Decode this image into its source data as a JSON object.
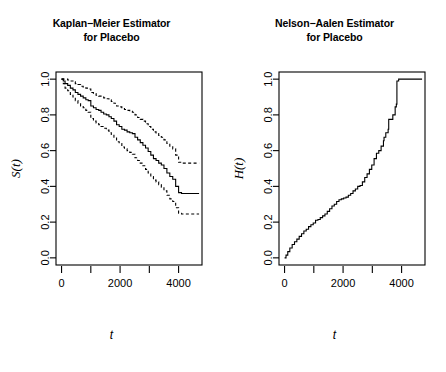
{
  "figure": {
    "background": "#ffffff",
    "line_color": "#000000",
    "width": 446,
    "height": 372
  },
  "panels": [
    {
      "name": "kaplan-meier",
      "title_line1": "Kaplan−Meier Estimator",
      "title_line2": "for Placebo",
      "xlabel": "t",
      "ylabel": "S(t)"
    },
    {
      "name": "nelson-aalen",
      "title_line1": "Nelson−Aalen Estimator",
      "title_line2": "for Placebo",
      "xlabel": "t",
      "ylabel": "H(t)"
    }
  ],
  "chart_data": [
    {
      "type": "line",
      "name": "kaplan-meier",
      "title": "Kaplan−Meier Estimator for Placebo",
      "xlabel": "t",
      "ylabel": "S(t)",
      "xlim": [
        -190,
        4800
      ],
      "ylim": [
        -0.04,
        1.04
      ],
      "xticks": [
        0,
        1000,
        2000,
        3000,
        4000
      ],
      "xtick_labels": [
        "0",
        "",
        "2000",
        "",
        "4000"
      ],
      "yticks": [
        0.0,
        0.2,
        0.4,
        0.6,
        0.8,
        1.0
      ],
      "ytick_labels": [
        "0.0",
        "0.2",
        "0.4",
        "0.6",
        "0.8",
        "1.0"
      ],
      "grid": false,
      "legend": null,
      "series": [
        {
          "name": "survival-estimate",
          "style": "solid",
          "step": true,
          "x": [
            0,
            60,
            120,
            210,
            300,
            390,
            470,
            560,
            650,
            740,
            830,
            910,
            1000,
            1090,
            1180,
            1270,
            1350,
            1440,
            1530,
            1620,
            1700,
            1790,
            1880,
            1970,
            2060,
            2150,
            2240,
            2330,
            2420,
            2510,
            2600,
            2690,
            2780,
            2870,
            2960,
            3050,
            3140,
            3230,
            3320,
            3410,
            3500,
            3600,
            3700,
            3800,
            3900,
            4000,
            4100,
            4700
          ],
          "y": [
            1.0,
            0.99,
            0.975,
            0.965,
            0.95,
            0.94,
            0.925,
            0.915,
            0.905,
            0.895,
            0.885,
            0.88,
            0.85,
            0.84,
            0.83,
            0.825,
            0.815,
            0.805,
            0.8,
            0.79,
            0.78,
            0.765,
            0.745,
            0.735,
            0.72,
            0.715,
            0.705,
            0.7,
            0.695,
            0.675,
            0.66,
            0.645,
            0.63,
            0.615,
            0.595,
            0.575,
            0.555,
            0.545,
            0.53,
            0.52,
            0.5,
            0.475,
            0.455,
            0.44,
            0.4,
            0.365,
            0.36,
            0.36
          ]
        },
        {
          "name": "upper-confidence-band",
          "style": "dashed",
          "step": true,
          "x": [
            0,
            60,
            120,
            210,
            300,
            390,
            470,
            560,
            650,
            740,
            830,
            910,
            1000,
            1090,
            1180,
            1270,
            1350,
            1440,
            1530,
            1620,
            1700,
            1790,
            1880,
            1970,
            2060,
            2150,
            2240,
            2330,
            2420,
            2510,
            2600,
            2690,
            2780,
            2870,
            2960,
            3050,
            3140,
            3230,
            3320,
            3410,
            3500,
            3600,
            3700,
            3800,
            3900,
            4000,
            4100,
            4700
          ],
          "y": [
            1.0,
            1.0,
            1.0,
            0.995,
            0.99,
            0.985,
            0.975,
            0.97,
            0.96,
            0.955,
            0.95,
            0.945,
            0.925,
            0.92,
            0.91,
            0.905,
            0.9,
            0.895,
            0.89,
            0.885,
            0.875,
            0.865,
            0.85,
            0.845,
            0.835,
            0.83,
            0.825,
            0.82,
            0.815,
            0.8,
            0.785,
            0.775,
            0.765,
            0.75,
            0.735,
            0.72,
            0.705,
            0.695,
            0.685,
            0.675,
            0.66,
            0.64,
            0.625,
            0.61,
            0.575,
            0.535,
            0.53,
            0.53
          ]
        },
        {
          "name": "lower-confidence-band",
          "style": "dashed",
          "step": true,
          "x": [
            0,
            60,
            120,
            210,
            300,
            390,
            470,
            560,
            650,
            740,
            830,
            910,
            1000,
            1090,
            1180,
            1270,
            1350,
            1440,
            1530,
            1620,
            1700,
            1790,
            1880,
            1970,
            2060,
            2150,
            2240,
            2330,
            2420,
            2510,
            2600,
            2690,
            2780,
            2870,
            2960,
            3050,
            3140,
            3230,
            3320,
            3410,
            3500,
            3600,
            3700,
            3800,
            3900,
            4000,
            4100,
            4700
          ],
          "y": [
            1.0,
            0.975,
            0.95,
            0.935,
            0.915,
            0.9,
            0.88,
            0.865,
            0.85,
            0.84,
            0.825,
            0.815,
            0.78,
            0.765,
            0.755,
            0.745,
            0.735,
            0.725,
            0.715,
            0.7,
            0.69,
            0.675,
            0.65,
            0.64,
            0.62,
            0.61,
            0.6,
            0.59,
            0.58,
            0.56,
            0.545,
            0.53,
            0.515,
            0.495,
            0.475,
            0.455,
            0.435,
            0.425,
            0.41,
            0.395,
            0.375,
            0.35,
            0.33,
            0.315,
            0.28,
            0.25,
            0.245,
            0.245
          ]
        }
      ]
    },
    {
      "type": "line",
      "name": "nelson-aalen",
      "title": "Nelson−Aalen Estimator for Placebo",
      "xlabel": "t",
      "ylabel": "H(t)",
      "xlim": [
        -190,
        4800
      ],
      "ylim": [
        -0.04,
        1.04
      ],
      "xticks": [
        0,
        1000,
        2000,
        3000,
        4000
      ],
      "xtick_labels": [
        "0",
        "",
        "2000",
        "",
        "4000"
      ],
      "yticks": [
        0.0,
        0.2,
        0.4,
        0.6,
        0.8,
        1.0
      ],
      "ytick_labels": [
        "0.0",
        "0.2",
        "0.4",
        "0.6",
        "0.8",
        "1.0"
      ],
      "grid": false,
      "legend": null,
      "series": [
        {
          "name": "cumulative-hazard",
          "style": "solid",
          "step": true,
          "x": [
            0,
            50,
            110,
            180,
            260,
            340,
            420,
            500,
            580,
            660,
            740,
            820,
            900,
            980,
            1060,
            1140,
            1220,
            1300,
            1380,
            1460,
            1540,
            1620,
            1700,
            1780,
            1860,
            1940,
            2020,
            2100,
            2180,
            2260,
            2340,
            2420,
            2500,
            2580,
            2660,
            2740,
            2820,
            2900,
            2980,
            3060,
            3140,
            3220,
            3300,
            3380,
            3400,
            3460,
            3540,
            3560,
            3620,
            3700,
            3780,
            3820,
            3840,
            3900,
            4700
          ],
          "y": [
            0.0,
            0.015,
            0.035,
            0.055,
            0.075,
            0.09,
            0.105,
            0.12,
            0.135,
            0.15,
            0.16,
            0.175,
            0.185,
            0.195,
            0.21,
            0.215,
            0.225,
            0.235,
            0.245,
            0.26,
            0.275,
            0.29,
            0.3,
            0.315,
            0.325,
            0.33,
            0.335,
            0.34,
            0.35,
            0.36,
            0.375,
            0.385,
            0.4,
            0.405,
            0.425,
            0.45,
            0.47,
            0.495,
            0.52,
            0.555,
            0.585,
            0.6,
            0.625,
            0.655,
            0.675,
            0.7,
            0.72,
            0.775,
            0.775,
            0.8,
            0.845,
            0.86,
            0.99,
            1.0,
            1.0
          ]
        }
      ]
    }
  ]
}
